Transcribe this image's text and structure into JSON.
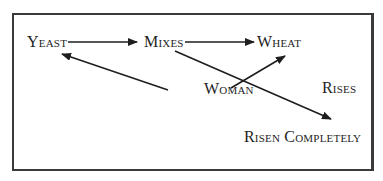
{
  "diagram": {
    "nodes": [
      {
        "id": "yeast",
        "label": "Yeast",
        "x": 27,
        "y": 34
      },
      {
        "id": "mixes",
        "label": "Mixes",
        "x": 144,
        "y": 34
      },
      {
        "id": "wheat",
        "label": "Wheat",
        "x": 257,
        "y": 34
      },
      {
        "id": "woman",
        "label": "Woman",
        "x": 205,
        "y": 81
      },
      {
        "id": "rises",
        "label": "Rises",
        "x": 322,
        "y": 80
      },
      {
        "id": "risen_completely",
        "label": "Risen Completely",
        "x": 244,
        "y": 129
      }
    ],
    "edges": [
      {
        "from": "yeast",
        "to": "mixes"
      },
      {
        "from": "mixes",
        "to": "wheat"
      },
      {
        "from": "woman",
        "to": "yeast"
      },
      {
        "from": "woman",
        "to": "wheat"
      },
      {
        "from": "mixes",
        "to": "risen_completely"
      }
    ],
    "colors": {
      "stroke": "#1e1e1e",
      "frame": "#3a3a3a",
      "background": "#ffffff"
    }
  }
}
